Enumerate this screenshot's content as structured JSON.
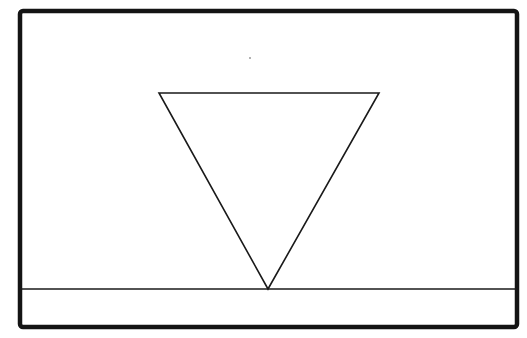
{
  "diagram": {
    "colors": {
      "background": "#ffffff",
      "stroke": "#1a1a1a",
      "frame": "#141414"
    },
    "frame": {
      "x": 20,
      "y": 11,
      "width": 497,
      "height": 316,
      "stroke_width": 4.5,
      "corner_radius": 3
    },
    "baseline": {
      "x1": 20,
      "y1": 289,
      "x2": 517,
      "y2": 289,
      "stroke_width": 1.6
    },
    "triangle": {
      "points": [
        [
          159,
          93
        ],
        [
          379,
          93
        ],
        [
          268,
          289
        ]
      ],
      "stroke_width": 1.6,
      "orientation": "inverted",
      "apex": [
        268,
        289
      ]
    },
    "speck": {
      "cx": 250,
      "cy": 58,
      "r": 1
    }
  }
}
